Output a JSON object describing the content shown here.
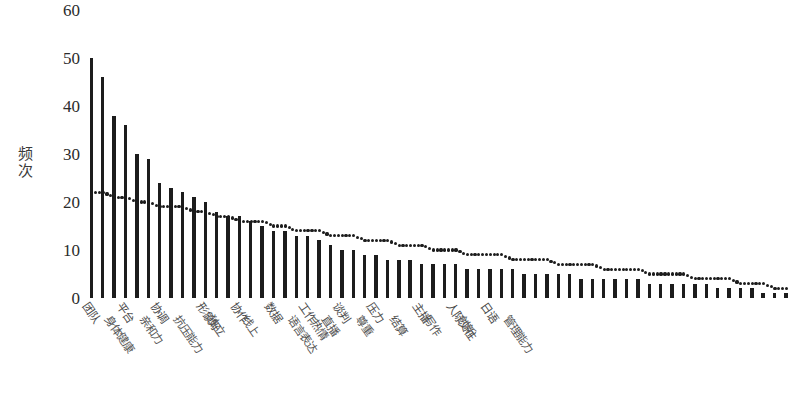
{
  "chart_data": {
    "type": "bar",
    "title": "",
    "subtitle": "",
    "xlabel": "",
    "ylabel": "频次",
    "ylim": [
      0,
      60
    ],
    "yticks": [
      0,
      10,
      20,
      30,
      40,
      50,
      60
    ],
    "grid": false,
    "legend": null,
    "categories": [
      "团队",
      "身体健康",
      "平台",
      "亲和力",
      "协调",
      "抗压能力",
      "形象好",
      "独立",
      "协作",
      "线上",
      "数据",
      "语言表达",
      "工作热情",
      "直播",
      "谈判",
      "尊重",
      "压力",
      "结算",
      "主播",
      "写作",
      "人际交往",
      "创新",
      "日语",
      "管理能力",
      "策划",
      "沟通",
      "执行力",
      "学习能力",
      "营销",
      "责任心",
      "细心",
      "耐心",
      "运营",
      "创意",
      "调研",
      "文案",
      "职业道德",
      "实践",
      "分析",
      "沟通技巧",
      "自律",
      "理解",
      "执着",
      "服务",
      "谈判技巧",
      "编辑",
      "调度",
      "规划",
      "活动",
      "统筹",
      "深度",
      "敏锐",
      "专注",
      "客服",
      "招商",
      "审核",
      "预算",
      "宣传",
      "应变",
      "技术",
      "跨界",
      "整合"
    ],
    "visible_tick_labels": [
      "团队",
      "身体健康",
      "平台",
      "亲和力",
      "协调",
      "抗压能力",
      "形象好",
      "独立",
      "协作",
      "线上",
      "数据",
      "语言表达",
      "工作热情",
      "直播",
      "谈判",
      "尊重",
      "压力",
      "结算",
      "主播",
      "写作",
      "人际交往",
      "创新",
      "日语",
      "管理能力"
    ],
    "values": [
      50,
      46,
      38,
      36,
      30,
      29,
      24,
      23,
      22,
      21,
      20,
      18,
      17,
      17,
      16,
      15,
      14,
      14,
      13,
      13,
      12,
      11,
      10,
      10,
      9,
      9,
      8,
      8,
      8,
      7,
      7,
      7,
      7,
      6,
      6,
      6,
      6,
      6,
      5,
      5,
      5,
      5,
      5,
      4,
      4,
      4,
      4,
      4,
      4,
      3,
      3,
      3,
      3,
      3,
      3,
      2,
      2,
      2,
      2,
      1,
      1,
      1
    ],
    "series": [
      {
        "name": "频次",
        "type": "bar",
        "values": [
          50,
          46,
          38,
          36,
          30,
          29,
          24,
          23,
          22,
          21,
          20,
          18,
          17,
          17,
          16,
          15,
          14,
          14,
          13,
          13,
          12,
          11,
          10,
          10,
          9,
          9,
          8,
          8,
          8,
          7,
          7,
          7,
          7,
          6,
          6,
          6,
          6,
          6,
          5,
          5,
          5,
          5,
          5,
          4,
          4,
          4,
          4,
          4,
          4,
          3,
          3,
          3,
          3,
          3,
          3,
          2,
          2,
          2,
          2,
          1,
          1,
          1
        ]
      },
      {
        "name": "趋势线",
        "type": "line",
        "style": "dotted",
        "values": [
          22,
          22,
          21,
          21,
          20,
          20,
          19,
          19,
          19,
          18,
          18,
          17,
          17,
          16,
          16,
          16,
          15,
          15,
          14,
          14,
          14,
          13,
          13,
          13,
          12,
          12,
          12,
          11,
          11,
          11,
          10,
          10,
          10,
          9,
          9,
          9,
          9,
          8,
          8,
          8,
          8,
          7,
          7,
          7,
          7,
          6,
          6,
          6,
          6,
          5,
          5,
          5,
          5,
          4,
          4,
          4,
          4,
          3,
          3,
          3,
          2,
          2
        ]
      }
    ]
  },
  "axis": {
    "y_title_chars": [
      "频",
      "次"
    ]
  }
}
